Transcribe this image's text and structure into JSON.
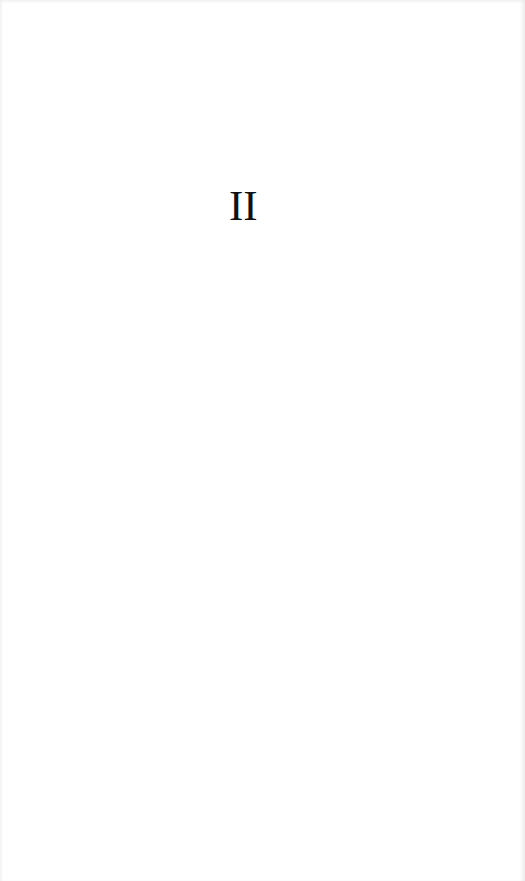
{
  "page": {
    "part_number": "II"
  }
}
